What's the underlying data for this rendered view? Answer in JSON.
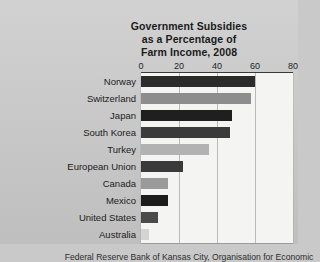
{
  "figure": {
    "background_color": "#c9c9c9",
    "plot_background_color": "#f4f4f2",
    "caption": "Federal Reserve Bank of Kansas City, Organisation for Economic"
  },
  "chart_data": {
    "type": "bar",
    "orientation": "horizontal",
    "title": "Government Subsidies as a Percentage of Farm Income, 2008",
    "title_lines": [
      "Government Subsidies",
      "as a Percentage of",
      "Farm Income, 2008"
    ],
    "xlabel": "",
    "ylabel": "",
    "xlim": [
      0,
      80
    ],
    "ylim": null,
    "grid": true,
    "grid_axis": "x",
    "legend": false,
    "axis_position": "top",
    "ticks": [
      {
        "label": "0",
        "value": 0
      },
      {
        "label": "20",
        "value": 20
      },
      {
        "label": "40",
        "value": 40
      },
      {
        "label": "60",
        "value": 60
      },
      {
        "label": "80",
        "value": 80
      }
    ],
    "categories": [
      "Norway",
      "Switzerland",
      "Japan",
      "South Korea",
      "Turkey",
      "European Union",
      "Canada",
      "Mexico",
      "United States",
      "Australia"
    ],
    "values": [
      60,
      58,
      48,
      47,
      36,
      22,
      14,
      14,
      9,
      4
    ],
    "bar_colors": [
      "#2b2b2b",
      "#8d8d8d",
      "#1f1f1f",
      "#3b3b3b",
      "#b2b2b2",
      "#3a3a3a",
      "#9a9a9a",
      "#1c1c1c",
      "#4a4a4a",
      "#d4d4d4"
    ],
    "bars": [
      {
        "category": "Norway",
        "value": 60,
        "color": "#2b2b2b"
      },
      {
        "category": "Switzerland",
        "value": 58,
        "color": "#8d8d8d"
      },
      {
        "category": "Japan",
        "value": 48,
        "color": "#1f1f1f"
      },
      {
        "category": "South Korea",
        "value": 47,
        "color": "#3b3b3b"
      },
      {
        "category": "Turkey",
        "value": 36,
        "color": "#b2b2b2"
      },
      {
        "category": "European Union",
        "value": 22,
        "color": "#3a3a3a"
      },
      {
        "category": "Canada",
        "value": 14,
        "color": "#9a9a9a"
      },
      {
        "category": "Mexico",
        "value": 14,
        "color": "#1c1c1c"
      },
      {
        "category": "United States",
        "value": 9,
        "color": "#4a4a4a"
      },
      {
        "category": "Australia",
        "value": 4,
        "color": "#d4d4d4"
      }
    ]
  }
}
